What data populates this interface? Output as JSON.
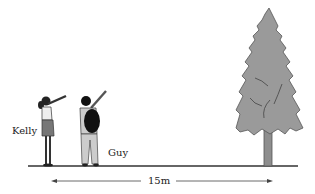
{
  "diagram": {
    "people": [
      {
        "name": "Kelly",
        "label_pos": [
          12,
          128
        ]
      },
      {
        "name": "Guy",
        "label_pos": [
          108,
          150
        ]
      }
    ],
    "object": {
      "name": "tree"
    },
    "distance": {
      "label": "15m",
      "from": "people",
      "to": "tree"
    },
    "colors": {
      "tree_fill": "#9a9a9a",
      "tree_outline": "#555555",
      "ground": "#333333",
      "arrow": "#444444"
    }
  }
}
